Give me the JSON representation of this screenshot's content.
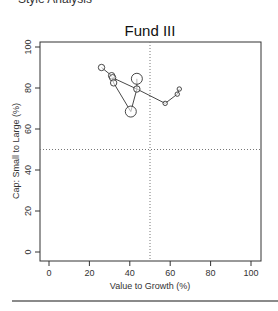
{
  "chart_data": {
    "type": "scatter",
    "title": "Fund III",
    "xlabel": "Value to Growth (%)",
    "ylabel": "Cap: Small to Large (%)",
    "xlim": [
      0,
      100
    ],
    "ylim": [
      0,
      100
    ],
    "xticks": [
      0,
      20,
      40,
      60,
      80,
      100
    ],
    "yticks": [
      0,
      20,
      40,
      60,
      80,
      100
    ],
    "reference_lines": {
      "x": 50,
      "y": 50,
      "style": "dotted"
    },
    "grid": false,
    "legend": null,
    "series": [
      {
        "name": "Fund III style drift",
        "connected": true,
        "points": [
          {
            "x": 26,
            "y": 90,
            "size": "small"
          },
          {
            "x": 31,
            "y": 86,
            "size": "small"
          },
          {
            "x": 31.5,
            "y": 85,
            "size": "small"
          },
          {
            "x": 32,
            "y": 82.5,
            "size": "small"
          },
          {
            "x": 40.5,
            "y": 68.5,
            "size": "large"
          },
          {
            "x": 43.5,
            "y": 79.5,
            "size": "small"
          },
          {
            "x": 43.5,
            "y": 84.5,
            "size": "large"
          },
          {
            "x": 57.5,
            "y": 72.5,
            "size": "tiny"
          },
          {
            "x": 63.5,
            "y": 77,
            "size": "tiny"
          },
          {
            "x": 64.5,
            "y": 79.5,
            "size": "tiny"
          }
        ]
      }
    ]
  },
  "header": {
    "cutoff_text": "Style Analysis"
  }
}
